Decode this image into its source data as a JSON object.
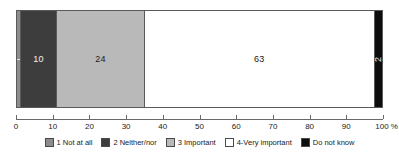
{
  "chart_data": {
    "type": "bar",
    "orientation": "horizontal",
    "stacked": true,
    "title": "",
    "subtitle": "",
    "xlabel": "",
    "ylabel": "",
    "xlim": [
      0,
      100
    ],
    "grid": false,
    "legend_position": "bottom",
    "axis": {
      "unit_suffix": "%",
      "ticks": [
        0,
        10,
        20,
        30,
        40,
        50,
        60,
        70,
        80,
        90,
        100
      ],
      "tick_labels": [
        "0",
        "10",
        "20",
        "30",
        "40",
        "50",
        "60",
        "70",
        "80",
        "90",
        "100 %"
      ]
    },
    "categories": [
      ""
    ],
    "series": [
      {
        "name": "1 Not at all",
        "values": [
          1
        ],
        "label": "1",
        "color": "#8c8c8c",
        "label_color": "on-dark"
      },
      {
        "name": "2 Neither/nor",
        "values": [
          10
        ],
        "label": "10",
        "color": "#3d3d3d",
        "label_color": "on-dark"
      },
      {
        "name": "3 Important",
        "values": [
          24
        ],
        "label": "24",
        "color": "#b9b9b9",
        "label_color": "on-light"
      },
      {
        "name": "4-Very important",
        "values": [
          63
        ],
        "label": "63",
        "color": "#ffffff",
        "label_color": "on-light"
      },
      {
        "name": "Do not know",
        "values": [
          2
        ],
        "label": "2",
        "color": "#0d0d0d",
        "label_color": "on-dark"
      }
    ]
  },
  "legend": {
    "items": [
      {
        "label": "1 Not at all",
        "color": "#8c8c8c"
      },
      {
        "label": "2 Neither/nor",
        "color": "#3d3d3d"
      },
      {
        "label": "3 Important",
        "color": "#b9b9b9"
      },
      {
        "label": "4-Very important",
        "color": "#ffffff"
      },
      {
        "label": "Do not know",
        "color": "#0d0d0d"
      }
    ]
  }
}
